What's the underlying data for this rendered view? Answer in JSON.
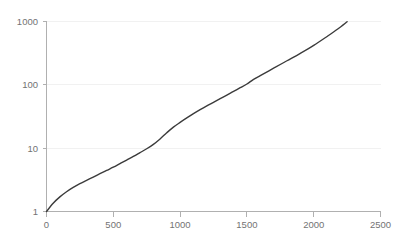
{
  "chart_data": {
    "type": "line",
    "title": "",
    "subtitle": "",
    "xlabel": "",
    "ylabel": "",
    "yscale": "log",
    "xscale": "linear",
    "xlim": [
      0,
      2500
    ],
    "ylim": [
      1,
      1000
    ],
    "grid": "horizontal",
    "legend": "none",
    "x_ticks": [
      "0",
      "500",
      "1000",
      "1500",
      "2000",
      "2500"
    ],
    "x_tick_values": [
      0,
      500,
      1000,
      1500,
      2000,
      2500
    ],
    "y_ticks": [
      "1",
      "10",
      "100",
      "1000"
    ],
    "y_tick_values": [
      1,
      10,
      100,
      1000
    ],
    "series": [
      {
        "name": "series-1",
        "color": "#3b3b3b",
        "x": [
          0,
          50,
          100,
          150,
          200,
          250,
          300,
          350,
          400,
          450,
          500,
          550,
          600,
          650,
          700,
          750,
          800,
          850,
          900,
          950,
          1000,
          1050,
          1100,
          1150,
          1200,
          1250,
          1300,
          1350,
          1400,
          1450,
          1500,
          1550,
          1600,
          1700,
          1800,
          1900,
          2000,
          2100,
          2180,
          2250
        ],
        "y": [
          1,
          1.35,
          1.7,
          2.05,
          2.4,
          2.75,
          3.1,
          3.5,
          3.95,
          4.45,
          5.0,
          5.7,
          6.5,
          7.4,
          8.5,
          9.8,
          11.5,
          14.0,
          17.5,
          21.5,
          25.5,
          30.0,
          35.0,
          40.5,
          46.5,
          53.0,
          60.5,
          69.0,
          79.0,
          90.0,
          103.0,
          122.0,
          140.0,
          183.0,
          240.0,
          315.0,
          420.0,
          580.0,
          760.0,
          990.0
        ]
      }
    ],
    "annotations": []
  },
  "axis": {
    "y_tick_1000": "1000",
    "y_tick_100": "100",
    "y_tick_10": "10",
    "y_tick_1": "1",
    "x_tick_0": "0",
    "x_tick_500": "500",
    "x_tick_1000": "1000",
    "x_tick_1500": "1500",
    "x_tick_2000": "2000",
    "x_tick_2500": "2500"
  },
  "colors": {
    "line": "#3b3b3b",
    "gridline": "#f1f1f1",
    "axis": "#b0b0b0",
    "tick_text": "#737373",
    "background": "#ffffff"
  }
}
